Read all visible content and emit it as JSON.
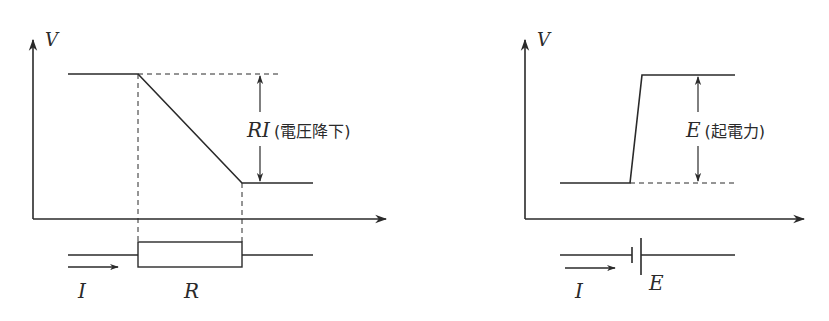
{
  "diagrams": [
    {
      "id": "resistor",
      "axis_label_y": "V",
      "annotation": {
        "symbol": "RI",
        "note": "(電圧降下)"
      },
      "circuit": {
        "current_label": "I",
        "component_label": "R",
        "component": "resistor"
      }
    },
    {
      "id": "battery",
      "axis_label_y": "V",
      "annotation": {
        "symbol": "E",
        "note": "(起電力)"
      },
      "circuit": {
        "current_label": "I",
        "component_label": "E",
        "component": "battery"
      }
    }
  ],
  "colors": {
    "stroke": "#2a2a2a",
    "background": "#ffffff"
  }
}
